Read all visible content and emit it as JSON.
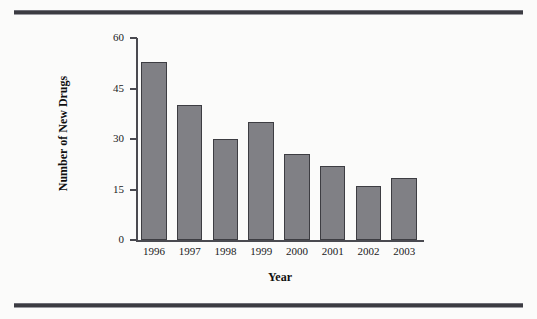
{
  "figure": {
    "background_color": "#fbfbfa",
    "rule_color": "#3c3c42",
    "bar_fill_color": "#808085",
    "bar_border_color": "#3d3d42",
    "axis_color": "#4a4a50"
  },
  "chart_data": {
    "type": "bar",
    "title": "",
    "subtitle": "",
    "xlabel": "Year",
    "ylabel": "Number of New Drugs",
    "categories": [
      "1996",
      "1997",
      "1998",
      "1999",
      "2000",
      "2001",
      "2002",
      "2003"
    ],
    "values": [
      53,
      40,
      30,
      35,
      25.5,
      22,
      16,
      18.5
    ],
    "series": [
      {
        "name": "Number of New Drugs",
        "values": [
          53,
          40,
          30,
          35,
          25.5,
          22,
          16,
          18.5
        ]
      }
    ],
    "ylim": [
      0,
      60
    ],
    "yticks": [
      0,
      15,
      30,
      45,
      60
    ],
    "ytick_labels": [
      "0",
      "15",
      "30",
      "45",
      "60"
    ],
    "xtick_labels": [
      "1996",
      "1997",
      "1998",
      "1999",
      "2000",
      "2001",
      "2002",
      "2003"
    ],
    "grid": false,
    "legend": null,
    "legend_position": "none",
    "annotations": []
  }
}
